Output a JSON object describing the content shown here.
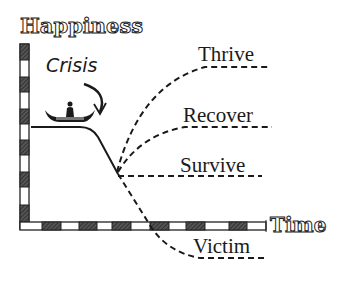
{
  "diagram": {
    "y_axis_label": "Happiness",
    "x_axis_label": "Time",
    "event_label": "Crisis",
    "event_icon": "canoe-icon",
    "outcomes": [
      {
        "label": "Thrive"
      },
      {
        "label": "Recover"
      },
      {
        "label": "Survive"
      },
      {
        "label": "Victim"
      }
    ],
    "colors": {
      "ink": "#1a1a1a",
      "background": "#ffffff",
      "hatch": "#444444"
    }
  }
}
